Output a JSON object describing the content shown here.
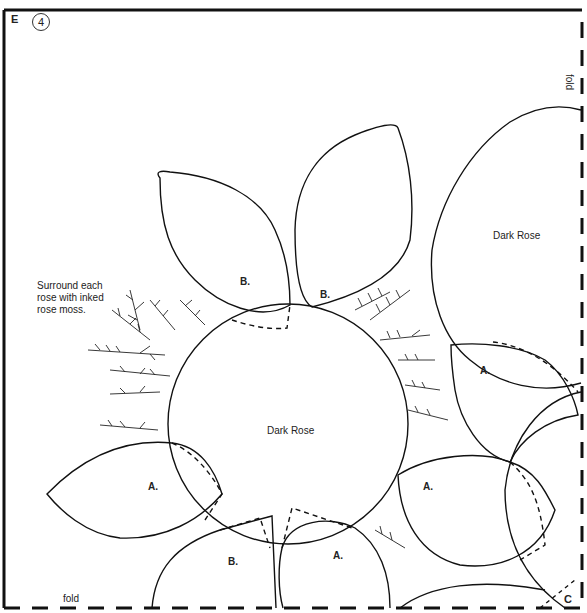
{
  "pattern": {
    "sheet_letter": "E",
    "step_number": "4",
    "instruction": "Surround each\nrose with inked\nrose moss.",
    "fold_labels": {
      "right": "fold",
      "bottom": "fold"
    },
    "corner_label": "C",
    "shapes": {
      "roses": [
        {
          "id": "rose-center",
          "label": "Dark Rose"
        },
        {
          "id": "rose-top-right",
          "label": "Dark Rose"
        }
      ],
      "leaves": [
        {
          "id": "leaf-top-left",
          "label": "B."
        },
        {
          "id": "leaf-top-right",
          "label": "B."
        },
        {
          "id": "leaf-left",
          "label": "A."
        },
        {
          "id": "leaf-bottom-left",
          "label": "B."
        },
        {
          "id": "leaf-bottom-center",
          "label": "A."
        },
        {
          "id": "leaf-right-lower",
          "label": "A."
        },
        {
          "id": "leaf-right-upper",
          "label": "A."
        }
      ]
    },
    "colors": {
      "line": "#111111",
      "background": "#ffffff"
    }
  }
}
